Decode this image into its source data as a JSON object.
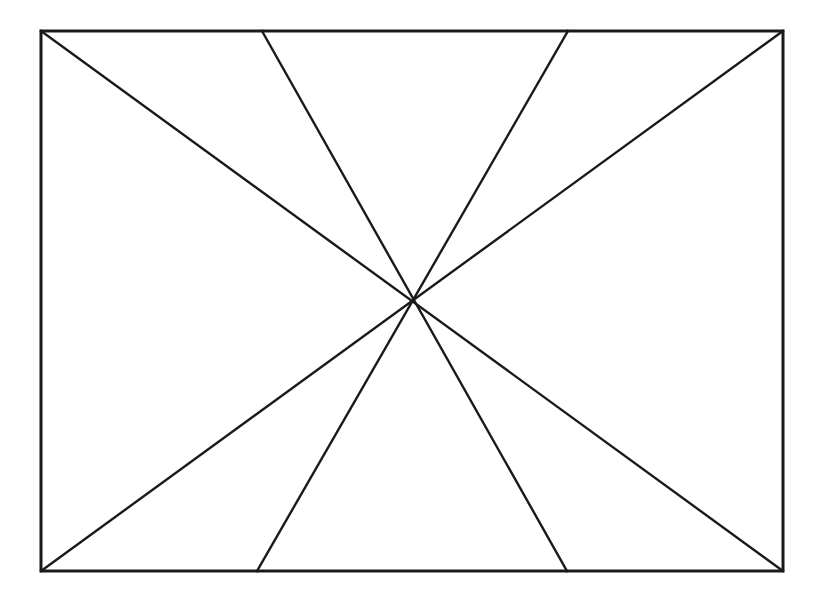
{
  "canvas": {
    "width": 825,
    "height": 602,
    "background_color": "#ffffff",
    "title": "Geometric line diagram"
  },
  "style": {
    "stroke_color": "#1a1a1a",
    "border_stroke_width": 3,
    "diagonal_stroke_width": 2.4,
    "fill": "none"
  },
  "figure": {
    "name": "rectangle-with-diagonal-lattice"
  },
  "chart_data": {
    "type": "diagram",
    "coordinate_space": {
      "x_range": [
        0,
        825
      ],
      "y_range": [
        0,
        602
      ],
      "origin": "top-left",
      "units": "pixels"
    },
    "rectangle": {
      "name": "outer-rectangle",
      "left": 41,
      "top": 31,
      "right": 783,
      "bottom": 571,
      "width": 742,
      "height": 540,
      "corners": {
        "top_left": [
          41,
          31
        ],
        "top_right": [
          783,
          31
        ],
        "bottom_right": [
          783,
          571
        ],
        "bottom_left": [
          41,
          571
        ]
      }
    },
    "edge_points": {
      "top_left_corner": [
        41,
        31
      ],
      "top_inner_left": [
        262,
        31
      ],
      "top_inner_right": [
        568,
        31
      ],
      "top_right_corner": [
        783,
        31
      ],
      "bottom_left_corner": [
        41,
        571
      ],
      "bottom_inner_left": [
        257,
        571
      ],
      "bottom_inner_right": [
        567,
        571
      ],
      "bottom_right_corner": [
        783,
        571
      ]
    },
    "lines": [
      {
        "id": "L1",
        "name": "main-diagonal-tl-br",
        "from": [
          41,
          31
        ],
        "to": [
          783,
          571
        ],
        "direction": "down-right",
        "angle_deg": -36
      },
      {
        "id": "L2",
        "name": "main-diagonal-tr-bl",
        "from": [
          783,
          31
        ],
        "to": [
          41,
          571
        ],
        "direction": "down-left",
        "angle_deg": 36
      },
      {
        "id": "L3",
        "name": "short-diagonal-top-left-to-bottom-right",
        "from": [
          262,
          31
        ],
        "to": [
          567,
          571
        ],
        "direction": "down-right",
        "angle_deg": -60
      },
      {
        "id": "L4",
        "name": "short-diagonal-top-right-to-bottom-left",
        "from": [
          568,
          31
        ],
        "to": [
          257,
          571
        ],
        "direction": "down-left",
        "angle_deg": 60
      }
    ],
    "intersections": [
      {
        "id": "X-top",
        "name": "upper-crossing",
        "point": [
          412,
          194
        ],
        "lines": [
          "L2",
          "L3"
        ]
      },
      {
        "id": "X-left",
        "name": "left-crossing",
        "point": [
          305,
          303
        ],
        "lines": [
          "L1",
          "L4"
        ]
      },
      {
        "id": "X-right",
        "name": "right-crossing",
        "point": [
          518,
          303
        ],
        "lines": [
          "L2",
          "L3"
        ]
      },
      {
        "id": "X-bottom",
        "name": "lower-crossing",
        "point": [
          412,
          410
        ],
        "lines": [
          "L1",
          "L4"
        ]
      }
    ],
    "counts": {
      "rectangles": 1,
      "diagonal_lines": 4,
      "interior_intersections": 4,
      "total_strokes": 5
    }
  }
}
